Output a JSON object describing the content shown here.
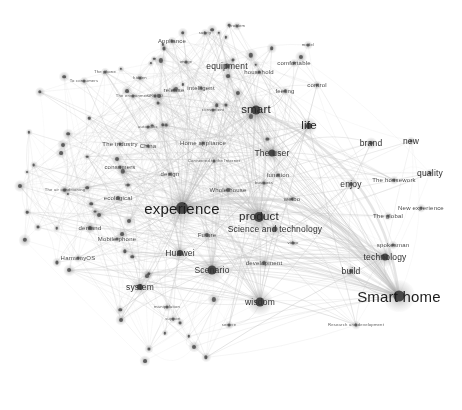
{
  "chart_data": {
    "type": "scatter",
    "title": "",
    "subtitle": "",
    "xlabel": "",
    "ylabel": "",
    "legend": [],
    "grid": false,
    "node_color": "#3a3a3a",
    "edge_color": "#b9b9b9",
    "highlight_edge_color": "#c9c9c9",
    "background": "#ffffff",
    "xlim": [
      0,
      462
    ],
    "ylim": [
      0,
      410
    ],
    "nodes": [
      {
        "label": "Smart home",
        "x": 399,
        "y": 296,
        "size": 11,
        "tier": "xl"
      },
      {
        "label": "experience",
        "x": 182,
        "y": 208,
        "size": 12,
        "tier": "xl"
      },
      {
        "label": "smart",
        "x": 256,
        "y": 110,
        "size": 9,
        "tier": "lg"
      },
      {
        "label": "product",
        "x": 259,
        "y": 217,
        "size": 10,
        "tier": "lg"
      },
      {
        "label": "Scenario",
        "x": 212,
        "y": 270,
        "size": 9,
        "tier": "md"
      },
      {
        "label": "wisdom",
        "x": 260,
        "y": 302,
        "size": 9,
        "tier": "md"
      },
      {
        "label": "life",
        "x": 309,
        "y": 126,
        "size": 6,
        "tier": "lg"
      },
      {
        "label": "The user",
        "x": 272,
        "y": 153,
        "size": 7,
        "tier": "md"
      },
      {
        "label": "Science and technology",
        "x": 275,
        "y": 229,
        "size": 5,
        "tier": "md"
      },
      {
        "label": "technology",
        "x": 385,
        "y": 257,
        "size": 7,
        "tier": "md"
      },
      {
        "label": "Huawei",
        "x": 180,
        "y": 253,
        "size": 6,
        "tier": "md"
      },
      {
        "label": "system",
        "x": 140,
        "y": 287,
        "size": 6,
        "tier": "md"
      },
      {
        "label": "build",
        "x": 351,
        "y": 271,
        "size": 4,
        "tier": "md"
      },
      {
        "label": "brand",
        "x": 371,
        "y": 143,
        "size": 4,
        "tier": "md"
      },
      {
        "label": "new",
        "x": 411,
        "y": 141,
        "size": 3,
        "tier": "md"
      },
      {
        "label": "enjoy",
        "x": 351,
        "y": 184,
        "size": 4,
        "tier": "md"
      },
      {
        "label": "quality",
        "x": 430,
        "y": 173,
        "size": 3,
        "tier": "md"
      },
      {
        "label": "The housework",
        "x": 394,
        "y": 180,
        "size": 3,
        "tier": "sm"
      },
      {
        "label": "New experience",
        "x": 421,
        "y": 208,
        "size": 3,
        "tier": "sm"
      },
      {
        "label": "The global",
        "x": 388,
        "y": 216,
        "size": 3,
        "tier": "sm"
      },
      {
        "label": "spokesman",
        "x": 393,
        "y": 245,
        "size": 3,
        "tier": "sm"
      },
      {
        "label": "equipment",
        "x": 227,
        "y": 66,
        "size": 5,
        "tier": "md"
      },
      {
        "label": "Whole house",
        "x": 228,
        "y": 190,
        "size": 4,
        "tier": "sm"
      },
      {
        "label": "Future",
        "x": 207,
        "y": 235,
        "size": 4,
        "tier": "sm"
      },
      {
        "label": "development",
        "x": 264,
        "y": 263,
        "size": 4,
        "tier": "sm"
      },
      {
        "label": "ecological",
        "x": 118,
        "y": 198,
        "size": 4,
        "tier": "sm"
      },
      {
        "label": "Mobile phone",
        "x": 117,
        "y": 239,
        "size": 3,
        "tier": "sm"
      },
      {
        "label": "HarmonyOS",
        "x": 78,
        "y": 258,
        "size": 3,
        "tier": "sm"
      },
      {
        "label": "demand",
        "x": 90,
        "y": 228,
        "size": 3,
        "tier": "sm"
      },
      {
        "label": "consumers",
        "x": 120,
        "y": 167,
        "size": 3,
        "tier": "sm"
      },
      {
        "label": "design",
        "x": 170,
        "y": 174,
        "size": 3,
        "tier": "sm"
      },
      {
        "label": "function",
        "x": 278,
        "y": 175,
        "size": 3,
        "tier": "sm"
      },
      {
        "label": "Home appliance",
        "x": 203,
        "y": 143,
        "size": 3,
        "tier": "sm"
      },
      {
        "label": "Connected to the Internet",
        "x": 214,
        "y": 161,
        "size": 3,
        "tier": "xs"
      },
      {
        "label": "China",
        "x": 148,
        "y": 146,
        "size": 3,
        "tier": "sm"
      },
      {
        "label": "The industry",
        "x": 120,
        "y": 144,
        "size": 3,
        "tier": "sm"
      },
      {
        "label": "business",
        "x": 264,
        "y": 183,
        "size": 3,
        "tier": "xs"
      },
      {
        "label": "weibo",
        "x": 292,
        "y": 199,
        "size": 3,
        "tier": "sm"
      },
      {
        "label": "video",
        "x": 293,
        "y": 243,
        "size": 3,
        "tier": "xs"
      },
      {
        "label": "intelligent",
        "x": 201,
        "y": 88,
        "size": 3,
        "tier": "sm"
      },
      {
        "label": "household",
        "x": 259,
        "y": 72,
        "size": 3,
        "tier": "sm"
      },
      {
        "label": "comfortable",
        "x": 294,
        "y": 63,
        "size": 3,
        "tier": "sm"
      },
      {
        "label": "control",
        "x": 317,
        "y": 85,
        "size": 3,
        "tier": "sm"
      },
      {
        "label": "feeling",
        "x": 285,
        "y": 91,
        "size": 3,
        "tier": "sm"
      },
      {
        "label": "model",
        "x": 308,
        "y": 45,
        "size": 3,
        "tier": "xs"
      },
      {
        "label": "safety",
        "x": 205,
        "y": 33,
        "size": 3,
        "tier": "xs"
      },
      {
        "label": "problem",
        "x": 237,
        "y": 26,
        "size": 3,
        "tier": "xs"
      },
      {
        "label": "Appliance",
        "x": 172,
        "y": 41,
        "size": 3,
        "tier": "sm"
      },
      {
        "label": "image",
        "x": 186,
        "y": 62,
        "size": 3,
        "tier": "xs"
      },
      {
        "label": "release",
        "x": 174,
        "y": 90,
        "size": 3,
        "tier": "sm"
      },
      {
        "label": "convenient",
        "x": 213,
        "y": 110,
        "size": 3,
        "tier": "xs"
      },
      {
        "label": "CROSO",
        "x": 155,
        "y": 96,
        "size": 3,
        "tier": "xs"
      },
      {
        "label": "automatic",
        "x": 148,
        "y": 127,
        "size": 3,
        "tier": "xs"
      },
      {
        "label": "The environment",
        "x": 133,
        "y": 96,
        "size": 3,
        "tier": "xs"
      },
      {
        "label": "hidden",
        "x": 140,
        "y": 78,
        "size": 3,
        "tier": "xs"
      },
      {
        "label": "The phone",
        "x": 105,
        "y": 72,
        "size": 3,
        "tier": "xs"
      },
      {
        "label": "To consumers",
        "x": 84,
        "y": 81,
        "size": 3,
        "tier": "xs"
      },
      {
        "label": "air",
        "x": 128,
        "y": 185,
        "size": 3,
        "tier": "xs"
      },
      {
        "label": "The air conditioning",
        "x": 65,
        "y": 190,
        "size": 3,
        "tier": "xs"
      },
      {
        "label": "support",
        "x": 173,
        "y": 319,
        "size": 3,
        "tier": "xs"
      },
      {
        "label": "manipulation",
        "x": 167,
        "y": 307,
        "size": 3,
        "tier": "xs"
      },
      {
        "label": "service",
        "x": 229,
        "y": 325,
        "size": 3,
        "tier": "xs"
      },
      {
        "label": "Research and development",
        "x": 356,
        "y": 325,
        "size": 3,
        "tier": "xs"
      }
    ],
    "unlabeled_node_count": 72,
    "highlight_arcs": [
      {
        "from": "experience",
        "to": "Smart home"
      },
      {
        "from": "smart",
        "to": "Smart home"
      },
      {
        "from": "experience",
        "to": "product"
      }
    ]
  },
  "figure": {
    "caption": "",
    "width": 462,
    "height": 410
  }
}
